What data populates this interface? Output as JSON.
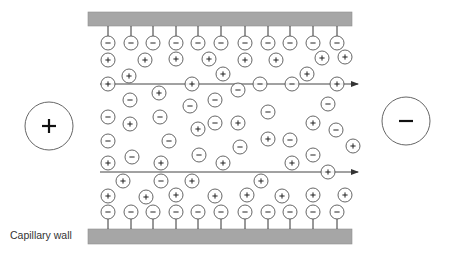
{
  "diagram": {
    "label_wall": "Capillary wall",
    "anode": {
      "symbol": "+",
      "cx": 49,
      "cy": 126,
      "r": 24
    },
    "cathode": {
      "symbol": "−",
      "cx": 406,
      "cy": 121,
      "r": 24
    },
    "colors": {
      "wall": "#a6a6a6",
      "stroke": "#555555",
      "text": "#222222"
    },
    "walls": [
      {
        "name": "top-wall",
        "x": 88,
        "y": 12,
        "w": 264,
        "h": 14
      },
      {
        "name": "bottom-wall",
        "x": 88,
        "y": 229,
        "w": 264,
        "h": 15
      }
    ],
    "flow_arrows": [
      {
        "x1": 100,
        "x2": 358,
        "y": 84
      },
      {
        "x1": 100,
        "x2": 358,
        "y": 172
      }
    ],
    "wall_ion_x": [
      108,
      131,
      153,
      176,
      198,
      221,
      245,
      268,
      290,
      313,
      337
    ],
    "top_wall_ion_y": 43,
    "bottom_wall_ion_y": 212,
    "ions": [
      {
        "q": "+",
        "x": 108,
        "y": 60
      },
      {
        "q": "+",
        "x": 145,
        "y": 60
      },
      {
        "q": "+",
        "x": 176,
        "y": 59
      },
      {
        "q": "+",
        "x": 209,
        "y": 59
      },
      {
        "q": "+",
        "x": 245,
        "y": 60
      },
      {
        "q": "+",
        "x": 276,
        "y": 60
      },
      {
        "q": "+",
        "x": 322,
        "y": 58
      },
      {
        "q": "+",
        "x": 345,
        "y": 57
      },
      {
        "q": "+",
        "x": 129,
        "y": 76
      },
      {
        "q": "+",
        "x": 223,
        "y": 74
      },
      {
        "q": "+",
        "x": 307,
        "y": 74
      },
      {
        "q": "+",
        "x": 108,
        "y": 84
      },
      {
        "q": "+",
        "x": 192,
        "y": 84
      },
      {
        "q": "−",
        "x": 260,
        "y": 84
      },
      {
        "q": "−",
        "x": 292,
        "y": 84
      },
      {
        "q": "+",
        "x": 337,
        "y": 84
      },
      {
        "q": "−",
        "x": 238,
        "y": 90
      },
      {
        "q": "+",
        "x": 159,
        "y": 93
      },
      {
        "q": "−",
        "x": 130,
        "y": 100
      },
      {
        "q": "−",
        "x": 215,
        "y": 100
      },
      {
        "q": "−",
        "x": 190,
        "y": 106
      },
      {
        "q": "−",
        "x": 328,
        "y": 104
      },
      {
        "q": "−",
        "x": 108,
        "y": 117
      },
      {
        "q": "−",
        "x": 160,
        "y": 117
      },
      {
        "q": "+",
        "x": 130,
        "y": 124
      },
      {
        "q": "−",
        "x": 268,
        "y": 112
      },
      {
        "q": "+",
        "x": 238,
        "y": 123
      },
      {
        "q": "+",
        "x": 313,
        "y": 123
      },
      {
        "q": "−",
        "x": 215,
        "y": 123
      },
      {
        "q": "+",
        "x": 198,
        "y": 129
      },
      {
        "q": "−",
        "x": 336,
        "y": 130
      },
      {
        "q": "−",
        "x": 108,
        "y": 141
      },
      {
        "q": "−",
        "x": 169,
        "y": 141
      },
      {
        "q": "+",
        "x": 268,
        "y": 139
      },
      {
        "q": "−",
        "x": 290,
        "y": 140
      },
      {
        "q": "−",
        "x": 240,
        "y": 147
      },
      {
        "q": "+",
        "x": 353,
        "y": 146
      },
      {
        "q": "+",
        "x": 108,
        "y": 163
      },
      {
        "q": "−",
        "x": 132,
        "y": 157
      },
      {
        "q": "+",
        "x": 161,
        "y": 163
      },
      {
        "q": "−",
        "x": 199,
        "y": 155
      },
      {
        "q": "+",
        "x": 223,
        "y": 163
      },
      {
        "q": "+",
        "x": 292,
        "y": 163
      },
      {
        "q": "−",
        "x": 313,
        "y": 155
      },
      {
        "q": "+",
        "x": 328,
        "y": 172
      },
      {
        "q": "+",
        "x": 123,
        "y": 181
      },
      {
        "q": "−",
        "x": 161,
        "y": 181
      },
      {
        "q": "+",
        "x": 192,
        "y": 181
      },
      {
        "q": "+",
        "x": 261,
        "y": 181
      },
      {
        "q": "+",
        "x": 108,
        "y": 196
      },
      {
        "q": "+",
        "x": 146,
        "y": 197
      },
      {
        "q": "+",
        "x": 176,
        "y": 195
      },
      {
        "q": "+",
        "x": 215,
        "y": 196
      },
      {
        "q": "+",
        "x": 247,
        "y": 195
      },
      {
        "q": "+",
        "x": 282,
        "y": 196
      },
      {
        "q": "+",
        "x": 313,
        "y": 195
      },
      {
        "q": "+",
        "x": 345,
        "y": 195
      }
    ]
  }
}
